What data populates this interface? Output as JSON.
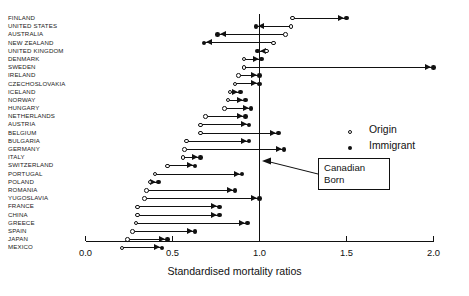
{
  "chart_data": {
    "type": "scatter",
    "title": "",
    "subtitle": "",
    "xlabel": "Standardised mortality ratios",
    "ylabel": "",
    "xlim": [
      0.0,
      2.0
    ],
    "xticks": [
      0.0,
      0.5,
      1.0,
      1.5,
      2.0
    ],
    "xtick_labels": [
      "0.0",
      "0.5",
      "1.0",
      "1.5",
      "2.0"
    ],
    "grid": false,
    "reference_line": {
      "value": 1.0,
      "label": "Canadian Born"
    },
    "legend": {
      "position": "right",
      "entries": [
        "Origin",
        "Immigrant"
      ]
    },
    "series": [
      {
        "name": "Origin",
        "marker": "open-circle"
      },
      {
        "name": "Immigrant",
        "marker": "filled-circle"
      }
    ],
    "categories": [
      "FINLAND",
      "UNITED STATES",
      "AUSTRALIA",
      "NEW ZEALAND",
      "UNITED KINGDOM",
      "DENMARK",
      "SWEDEN",
      "IRELAND",
      "CZECHOSLOVAKIA",
      "ICELAND",
      "NORWAY",
      "HUNGARY",
      "NETHERLANDS",
      "AUSTRIA",
      "BELGIUM",
      "BULGARIA",
      "GERMANY",
      "ITALY",
      "SWITZERLAND",
      "PORTUGAL",
      "POLAND",
      "ROMANIA",
      "YUGOSLAVIA",
      "FRANCE",
      "CHINA",
      "GREECE",
      "SPAIN",
      "JAPAN",
      "MEXICO"
    ],
    "rows": [
      {
        "country": "FINLAND",
        "origin": 1.19,
        "immigrant": 1.5
      },
      {
        "country": "UNITED STATES",
        "origin": 1.18,
        "immigrant": 0.98
      },
      {
        "country": "AUSTRALIA",
        "origin": 1.15,
        "immigrant": 0.76
      },
      {
        "country": "NEW ZEALAND",
        "origin": 1.08,
        "immigrant": 0.68
      },
      {
        "country": "UNITED KINGDOM",
        "origin": 1.04,
        "immigrant": 0.99
      },
      {
        "country": "DENMARK",
        "origin": 0.91,
        "immigrant": 1.01
      },
      {
        "country": "SWEDEN",
        "origin": 0.91,
        "immigrant": 2.0
      },
      {
        "country": "IRELAND",
        "origin": 0.88,
        "immigrant": 1.0
      },
      {
        "country": "CZECHOSLOVAKIA",
        "origin": 0.86,
        "immigrant": 1.0
      },
      {
        "country": "ICELAND",
        "origin": 0.83,
        "immigrant": 0.89
      },
      {
        "country": "NORWAY",
        "origin": 0.82,
        "immigrant": 0.92
      },
      {
        "country": "HUNGARY",
        "origin": 0.8,
        "immigrant": 0.95
      },
      {
        "country": "NETHERLANDS",
        "origin": 0.69,
        "immigrant": 0.92
      },
      {
        "country": "AUSTRIA",
        "origin": 0.66,
        "immigrant": 0.94
      },
      {
        "country": "BELGIUM",
        "origin": 0.66,
        "immigrant": 1.11
      },
      {
        "country": "BULGARIA",
        "origin": 0.58,
        "immigrant": 0.94
      },
      {
        "country": "GERMANY",
        "origin": 0.57,
        "immigrant": 1.14
      },
      {
        "country": "ITALY",
        "origin": 0.56,
        "immigrant": 0.66
      },
      {
        "country": "SWITZERLAND",
        "origin": 0.47,
        "immigrant": 0.63
      },
      {
        "country": "PORTUGAL",
        "origin": 0.4,
        "immigrant": 0.9
      },
      {
        "country": "POLAND",
        "origin": 0.37,
        "immigrant": 0.42
      },
      {
        "country": "ROMANIA",
        "origin": 0.35,
        "immigrant": 0.86
      },
      {
        "country": "YUGOSLAVIA",
        "origin": 0.34,
        "immigrant": 1.0
      },
      {
        "country": "FRANCE",
        "origin": 0.3,
        "immigrant": 0.77
      },
      {
        "country": "CHINA",
        "origin": 0.3,
        "immigrant": 0.77
      },
      {
        "country": "GREECE",
        "origin": 0.29,
        "immigrant": 0.93
      },
      {
        "country": "SPAIN",
        "origin": 0.27,
        "immigrant": 0.63
      },
      {
        "country": "JAPAN",
        "origin": 0.24,
        "immigrant": 0.47
      },
      {
        "country": "MEXICO",
        "origin": 0.21,
        "immigrant": 0.44
      }
    ]
  },
  "legend": {
    "origin_label": "Origin",
    "immigrant_label": "Immigrant"
  },
  "annotation": {
    "line1": "Canadian",
    "line2": "Born"
  },
  "axis": {
    "title": "Standardised mortality ratios",
    "ticks": [
      "0.0",
      "0.5",
      "1.0",
      "1.5",
      "2.0"
    ]
  }
}
